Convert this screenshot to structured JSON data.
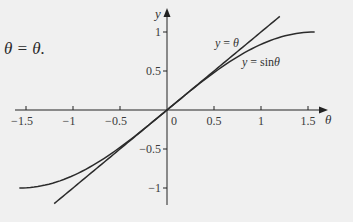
{
  "caption_fragment": "θ = θ.",
  "chart_data": {
    "type": "line",
    "title": "",
    "xlabel": "θ",
    "ylabel": "y",
    "xlim": [
      -1.6,
      1.65
    ],
    "ylim": [
      -1.25,
      1.3
    ],
    "grid": false,
    "legend": "inline labels",
    "x_ticks": [
      -1.5,
      -1,
      -0.5,
      0,
      0.5,
      1,
      1.5
    ],
    "x_tick_labels": [
      "−1.5",
      "−1",
      "−0.5",
      "0",
      "0.5",
      "1",
      "1.5"
    ],
    "y_ticks": [
      -1,
      -0.5,
      0.5,
      1
    ],
    "y_tick_labels": [
      "−1",
      "−0.5",
      "0.5",
      "1"
    ],
    "origin_label": "0",
    "series": [
      {
        "name": "y = θ",
        "label": "y = θ",
        "function": "theta",
        "domain": [
          -1.2,
          1.2
        ],
        "x": [
          -1.2,
          -0.6,
          0,
          0.6,
          1.2
        ],
        "values": [
          -1.2,
          -0.6,
          0,
          0.6,
          1.2
        ]
      },
      {
        "name": "y = sinθ",
        "label": "y = sinθ",
        "function": "sin",
        "domain": [
          -1.5708,
          1.5708
        ],
        "x": [
          -1.5708,
          -1.2,
          -0.8,
          -0.4,
          0,
          0.4,
          0.8,
          1.2,
          1.5708
        ],
        "values": [
          -1.0,
          -0.932,
          -0.717,
          -0.389,
          0,
          0.389,
          0.717,
          0.932,
          1.0
        ]
      }
    ]
  },
  "style": {
    "background": "#f0f0f0",
    "axis_color": "#222222",
    "curve_color": "#2b2b2b"
  }
}
